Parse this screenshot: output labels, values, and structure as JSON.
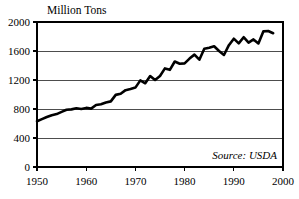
{
  "chart_data": {
    "type": "line",
    "title": "Million Tons",
    "xlabel": "",
    "ylabel": "",
    "xlim": [
      1950,
      2000
    ],
    "ylim": [
      0,
      2000
    ],
    "ytick_values": [
      0,
      400,
      800,
      1200,
      1600,
      2000
    ],
    "ytick_labels": [
      "0",
      "400",
      "800",
      "1200",
      "1600",
      "2000"
    ],
    "xtick_values": [
      1950,
      1960,
      1970,
      1980,
      1990,
      2000
    ],
    "xtick_labels": [
      "1950",
      "1960",
      "1970",
      "1980",
      "1990",
      "2000"
    ],
    "grid": "horizontal",
    "legend": "none",
    "annotation": "Source: USDA",
    "line_color": "#000000",
    "series": [
      {
        "name": "Grain Production",
        "x": [
          1950,
          1951,
          1952,
          1953,
          1954,
          1955,
          1956,
          1957,
          1958,
          1959,
          1960,
          1961,
          1962,
          1963,
          1964,
          1965,
          1966,
          1967,
          1968,
          1969,
          1970,
          1971,
          1972,
          1973,
          1974,
          1975,
          1976,
          1977,
          1978,
          1979,
          1980,
          1981,
          1982,
          1983,
          1984,
          1985,
          1986,
          1987,
          1988,
          1989,
          1990,
          1991,
          1992,
          1993,
          1994,
          1995,
          1996,
          1997,
          1998
        ],
        "values": [
          631,
          660,
          690,
          715,
          730,
          760,
          790,
          795,
          810,
          800,
          815,
          805,
          855,
          865,
          890,
          905,
          995,
          1010,
          1060,
          1075,
          1095,
          1195,
          1155,
          1255,
          1200,
          1255,
          1360,
          1340,
          1455,
          1425,
          1430,
          1495,
          1550,
          1480,
          1630,
          1645,
          1665,
          1600,
          1545,
          1680,
          1770,
          1705,
          1790,
          1715,
          1760,
          1705,
          1870,
          1875,
          1845
        ]
      }
    ]
  },
  "axis": {
    "title": "Million Tons",
    "source_note": "Source: USDA"
  }
}
